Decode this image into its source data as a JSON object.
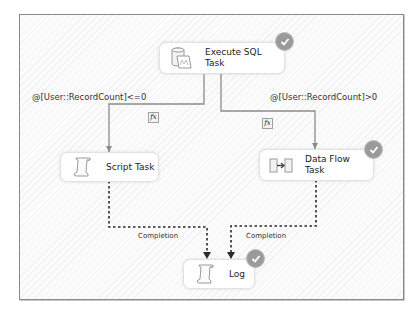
{
  "diagram": {
    "type": "control-flow",
    "nodes": [
      {
        "id": "execute-sql",
        "label": "Execute SQL\nTask",
        "label_lines": [
          "Execute SQL",
          "Task"
        ],
        "icon": "sql-task-icon",
        "status": "success"
      },
      {
        "id": "script-task",
        "label": "Script Task",
        "label_lines": [
          "Script Task"
        ],
        "icon": "script-scroll-icon",
        "status": "none"
      },
      {
        "id": "data-flow",
        "label": "Data Flow\nTask",
        "label_lines": [
          "Data Flow",
          "Task"
        ],
        "icon": "data-flow-icon",
        "status": "success"
      },
      {
        "id": "log",
        "label": "Log",
        "label_lines": [
          "Log"
        ],
        "icon": "script-scroll-icon",
        "status": "success"
      }
    ],
    "edges": [
      {
        "from": "execute-sql",
        "to": "script-task",
        "type": "expression",
        "label": "@[User::RecordCount]<=0",
        "badge": "fx"
      },
      {
        "from": "execute-sql",
        "to": "data-flow",
        "type": "expression",
        "label": "@[User::RecordCount]>0",
        "badge": "fx"
      },
      {
        "from": "script-task",
        "to": "log",
        "type": "completion",
        "label": "Completion"
      },
      {
        "from": "data-flow",
        "to": "log",
        "type": "completion",
        "label": "Completion"
      }
    ],
    "colors": {
      "canvas_border": "#8a8a8a",
      "connector": "#8c8c8c",
      "completion": "#2a2a2a",
      "check_badge": "#9a9a9a"
    }
  }
}
